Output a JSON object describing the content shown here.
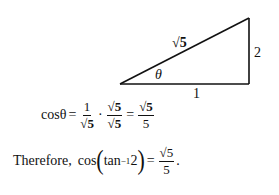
{
  "triangle": {
    "hypotenuse_label": "√5",
    "opposite_label": "2",
    "adjacent_label": "1",
    "angle_label": "θ"
  },
  "equation1": {
    "lhs": "cosθ",
    "equals": "=",
    "frac1": {
      "num": "1",
      "den": "√5"
    },
    "dot": "·",
    "frac2": {
      "num": "√5",
      "den": "√5"
    },
    "equals2": "=",
    "frac3": {
      "num": "√5",
      "den": "5"
    }
  },
  "conclusion": {
    "prefix": "Therefore,",
    "fn": "cos",
    "lparen": "(",
    "inner": "tan",
    "sup": "−1",
    "arg": "2",
    "rparen": ")",
    "equals": "=",
    "frac": {
      "num": "√5",
      "den": "5"
    },
    "period": "."
  }
}
